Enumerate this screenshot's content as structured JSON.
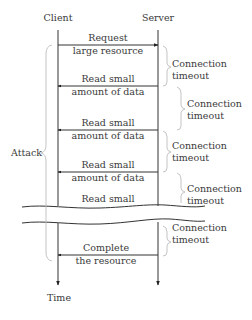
{
  "participants": {
    "client": "Client",
    "server": "Server"
  },
  "messages": [
    {
      "direction": "client-to-server",
      "line1": "Request",
      "line2": "large resource"
    },
    {
      "direction": "server-to-client",
      "line1": "Read small",
      "line2": "amount of data"
    },
    {
      "direction": "server-to-client",
      "line1": "Read small",
      "line2": "amount of data"
    },
    {
      "direction": "server-to-client",
      "line1": "Read small",
      "line2": "amount of data"
    },
    {
      "direction": "server-to-client",
      "line1": "Read small",
      "line2": ""
    },
    {
      "direction": "server-to-client",
      "line1": "Complete",
      "line2": "the resource"
    }
  ],
  "timeouts": [
    {
      "line1": "Connection",
      "line2": "timeout"
    },
    {
      "line1": "Connection",
      "line2": "timeout"
    },
    {
      "line1": "Connection",
      "line2": "timeout"
    },
    {
      "line1": "Connection",
      "line2": "timeout"
    },
    {
      "line1": "Connection",
      "line2": "timeout"
    }
  ],
  "attack_label": "Attack",
  "time_label": "Time"
}
